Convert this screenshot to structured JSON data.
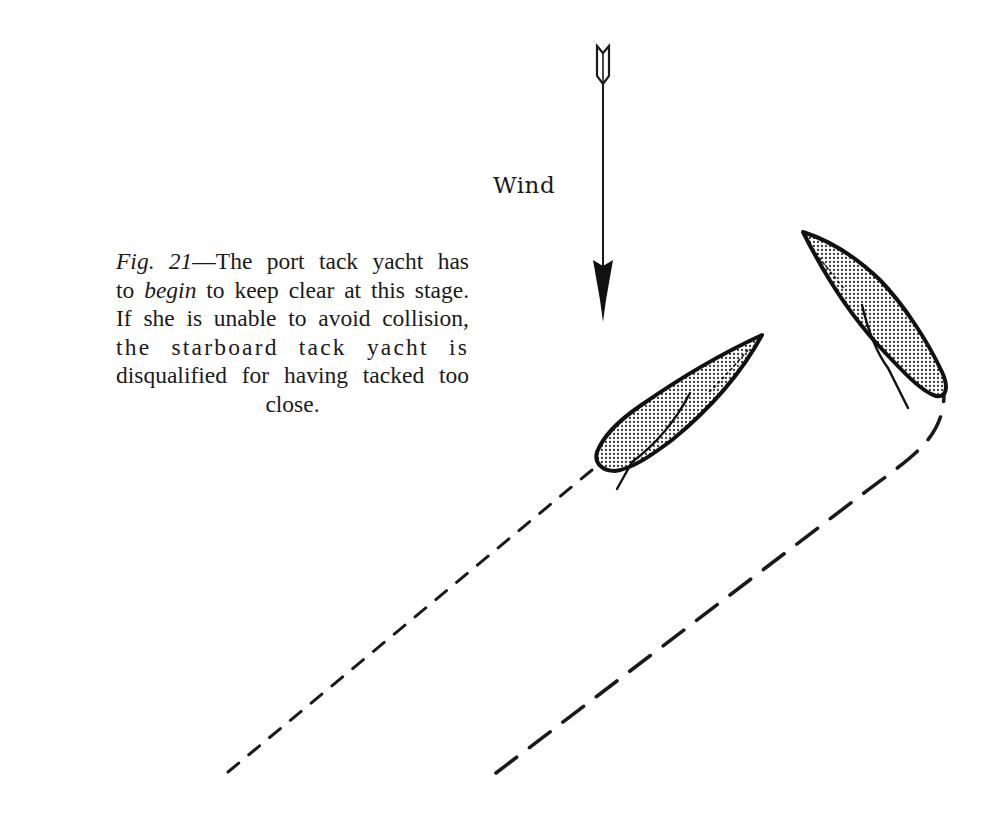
{
  "figure": {
    "caption": {
      "fig_label": "Fig. 21",
      "dash": "—",
      "line1_rest": "The port tack yacht has",
      "line2_pre": "to ",
      "line2_em": "begin",
      "line2_rest": " to keep clear at this stage.",
      "line3": "If she is unable to avoid collision,",
      "line4": "the starboard tack yacht is",
      "line5": "disqualified for having tacked too",
      "line6": "close."
    },
    "wind": {
      "label": "Wind",
      "direction": "down"
    },
    "yachts": [
      {
        "name": "port tack yacht",
        "tack": "port",
        "track_style": "short dashes"
      },
      {
        "name": "starboard tack yacht",
        "tack": "starboard",
        "track_style": "long dashes, curving (tacked)"
      }
    ],
    "colors": {
      "ink": "#1a1a1a",
      "hull_fill": "#c9c9c9",
      "background": "#ffffff"
    }
  }
}
